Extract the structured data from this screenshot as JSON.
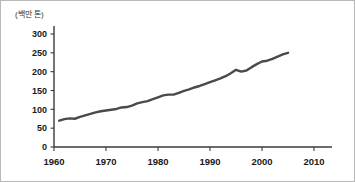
{
  "chart_data": {
    "type": "line",
    "title": "",
    "subtitle": "",
    "unit_label": "(백만 톤)",
    "xlabel": "",
    "ylabel": "",
    "xlim": [
      1960,
      2010
    ],
    "ylim": [
      0,
      300
    ],
    "grid": false,
    "legend": "none",
    "xticks": [
      "1960",
      "1970",
      "1980",
      "1990",
      "2000",
      "2010"
    ],
    "xtick_values": [
      1960,
      1970,
      1980,
      1990,
      2000,
      2010
    ],
    "yticks": [
      "0",
      "50",
      "100",
      "150",
      "200",
      "250",
      "300"
    ],
    "ytick_values": [
      0,
      50,
      100,
      150,
      200,
      250,
      300
    ],
    "line_color": "#4a4a4a",
    "series": [
      {
        "name": "production",
        "x": [
          1961,
          1962,
          1963,
          1964,
          1965,
          1966,
          1967,
          1968,
          1969,
          1970,
          1971,
          1972,
          1973,
          1974,
          1975,
          1976,
          1977,
          1978,
          1979,
          1980,
          1981,
          1982,
          1983,
          1984,
          1985,
          1986,
          1987,
          1988,
          1989,
          1990,
          1991,
          1992,
          1993,
          1994,
          1995,
          1996,
          1997,
          1998,
          1999,
          2000,
          2001,
          2002,
          2003,
          2004,
          2005
        ],
        "values": [
          70,
          74,
          76,
          75,
          80,
          84,
          88,
          92,
          95,
          97,
          99,
          101,
          105,
          106,
          110,
          116,
          119,
          122,
          127,
          132,
          137,
          139,
          139,
          144,
          149,
          153,
          158,
          162,
          167,
          172,
          177,
          182,
          188,
          196,
          205,
          200,
          203,
          212,
          220,
          227,
          229,
          234,
          240,
          246,
          250
        ]
      }
    ]
  }
}
